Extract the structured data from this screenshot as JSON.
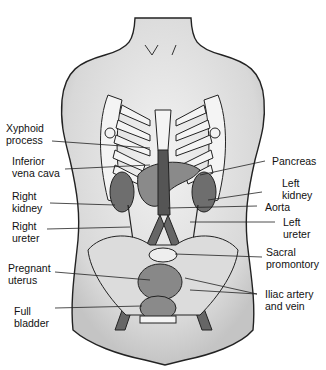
{
  "diagram": {
    "labels": {
      "xyphoid": "Xyphoid\nprocess",
      "ivc": "Inferior\nvena cava",
      "right_kidney": "Right\nkidney",
      "right_ureter": "Right\nureter",
      "pregnant_uterus": "Pregnant\nuterus",
      "full_bladder": "Full\nbladder",
      "pancreas": "Pancreas",
      "left_kidney": "Left\nkidney",
      "aorta": "Aorta",
      "left_ureter": "Left\nureter",
      "sacral": "Sacral\npromontory",
      "iliac": "Iliac artery\nand vein"
    }
  }
}
